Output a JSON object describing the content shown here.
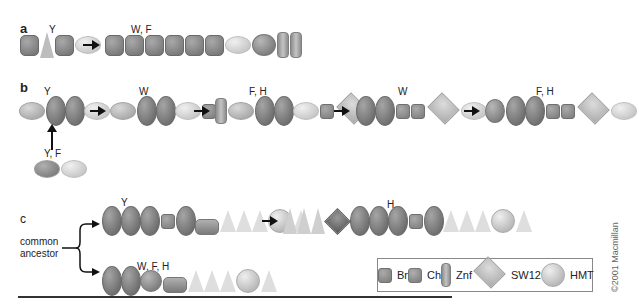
{
  "panels": {
    "a": {
      "label": "a",
      "row1_site": "Y",
      "row2_site": "W, F"
    },
    "b": {
      "label": "b",
      "stage1_site": "Y",
      "stage2_site": "W",
      "stage3_site": "F, H",
      "stage4_site": "W",
      "stage5_site": "F, H",
      "ancestor_site": "Y, F"
    },
    "c": {
      "label": "c",
      "ancestor_label_line1": "common",
      "ancestor_label_line2": "ancestor",
      "upper_site": "Y",
      "upper_derived_site": "H",
      "lower_site": "W, F, H"
    }
  },
  "legend": {
    "items": [
      {
        "key": "br",
        "label": "Br"
      },
      {
        "key": "ch",
        "label": "Ch"
      },
      {
        "key": "znf",
        "label": "Znf"
      },
      {
        "key": "sw12",
        "label": "SW12"
      },
      {
        "key": "hmt",
        "label": "HMT"
      }
    ]
  },
  "copyright": "©2001 Macmillan"
}
